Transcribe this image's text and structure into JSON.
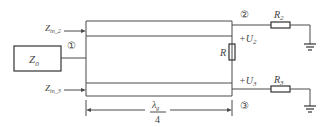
{
  "diagram": {
    "type": "quarter-wave power divider (Wilkinson)",
    "source_impedance": {
      "label": "Z",
      "sub": "0"
    },
    "input_impedance_2": {
      "label": "Z",
      "sub": "in_2"
    },
    "input_impedance_3": {
      "label": "Z",
      "sub": "in_3"
    },
    "ports": {
      "port1": "①",
      "port2": "②",
      "port3": "③"
    },
    "isolation_resistor": {
      "label": "R"
    },
    "load_resistor_2": {
      "label": "R",
      "sub": "2"
    },
    "load_resistor_3": {
      "label": "R",
      "sub": "3"
    },
    "voltage_2": {
      "prefix": "+U",
      "sub": "2"
    },
    "voltage_3": {
      "prefix": "+U",
      "sub": "3"
    },
    "length_dimension": {
      "numerator": "λ",
      "num_sub": "g",
      "denominator": "4"
    },
    "colors": {
      "line": "#4a4a4a",
      "text": "#444444",
      "background": "#ffffff"
    }
  }
}
